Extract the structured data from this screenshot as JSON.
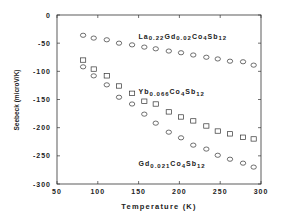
{
  "chart_data": {
    "type": "scatter",
    "title": "",
    "xlabel": "Temperature (K)",
    "ylabel": "Seebeck (microV/K)",
    "xlim": [
      50,
      300
    ],
    "ylim": [
      -300,
      0
    ],
    "xticks": [
      50,
      100,
      150,
      200,
      250,
      300
    ],
    "yticks": [
      0,
      -50,
      -100,
      -150,
      -200,
      -250,
      -300
    ],
    "grid": false,
    "legend": "inline annotations",
    "series": [
      {
        "name": "La0.22Gd0.02Co4Sb12",
        "marker": "circle",
        "x": [
          82,
          95,
          111,
          126,
          142,
          157,
          171,
          187,
          202,
          217,
          233,
          247,
          262,
          278,
          291
        ],
        "y": [
          -36,
          -41,
          -44,
          -50,
          -53,
          -57,
          -60,
          -64,
          -67,
          -71,
          -75,
          -78,
          -82,
          -83,
          -89
        ]
      },
      {
        "name": "Yb0.066Co4Sb12",
        "marker": "square",
        "x": [
          82,
          95,
          111,
          126,
          142,
          157,
          171,
          187,
          202,
          217,
          233,
          247,
          262,
          278,
          291
        ],
        "y": [
          -80,
          -96,
          -108,
          -126,
          -139,
          -153,
          -158,
          -172,
          -181,
          -188,
          -197,
          -206,
          -211,
          -217,
          -220
        ]
      },
      {
        "name": "Gd0.021Co4Sb12",
        "marker": "circle",
        "x": [
          82,
          95,
          111,
          126,
          142,
          157,
          171,
          187,
          202,
          217,
          233,
          247,
          262,
          278,
          291
        ],
        "y": [
          -92,
          -108,
          -124,
          -146,
          -158,
          -176,
          -192,
          -208,
          -218,
          -231,
          -238,
          -249,
          -256,
          -263,
          -270
        ]
      }
    ],
    "annotations": [
      {
        "text": "La0.22Gd0.02Co4Sb12",
        "parts": [
          "La",
          "0.22",
          "Gd",
          "0.02",
          "Co",
          "4",
          "Sb",
          "12"
        ],
        "x": 150,
        "y": -42
      },
      {
        "text": "Yb0.066Co4Sb12",
        "parts": [
          "Yb",
          "0.066",
          "Co",
          "4",
          "Sb",
          "12"
        ],
        "x": 150,
        "y": -140
      },
      {
        "text": "Gd0.021Co4Sb12",
        "parts": [
          "Gd",
          "0.021",
          "Co",
          "4",
          "Sb",
          "12"
        ],
        "x": 150,
        "y": -268
      }
    ]
  }
}
